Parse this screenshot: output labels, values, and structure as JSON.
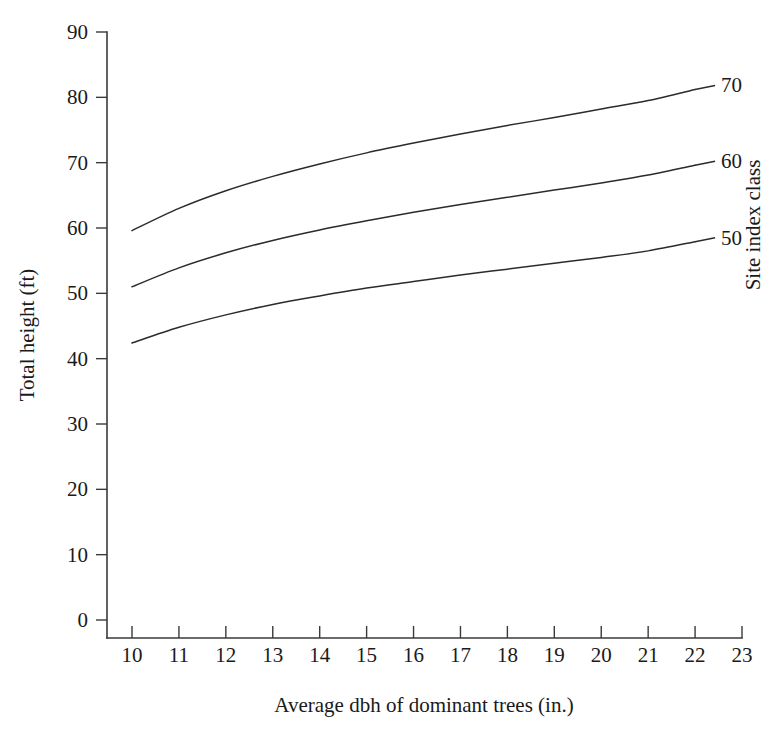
{
  "chart_data": {
    "type": "line",
    "title": "",
    "xlabel": "Average dbh of dominant trees (in.)",
    "ylabel": "Total height (ft)",
    "legend_title": "Site index class",
    "legend_position": "right-of-curve-ends",
    "grid": false,
    "xlim": [
      10,
      23
    ],
    "ylim": [
      0,
      90
    ],
    "xticks": [
      10,
      11,
      12,
      13,
      14,
      15,
      16,
      17,
      18,
      19,
      20,
      21,
      22,
      23
    ],
    "yticks": [
      0,
      10,
      20,
      30,
      40,
      50,
      60,
      70,
      80,
      90
    ],
    "xtick_labels": [
      "10",
      "11",
      "12",
      "13",
      "14",
      "15",
      "16",
      "17",
      "18",
      "19",
      "20",
      "21",
      "22",
      "23"
    ],
    "ytick_labels": [
      "0",
      "10",
      "20",
      "30",
      "40",
      "50",
      "60",
      "70",
      "80",
      "90"
    ],
    "x": [
      10,
      11,
      12,
      13,
      14,
      15,
      16,
      17,
      18,
      19,
      20,
      21,
      22
    ],
    "series": [
      {
        "name": "70",
        "label": "70",
        "values": [
          59.6,
          63.0,
          65.7,
          67.9,
          69.8,
          71.5,
          73.0,
          74.4,
          75.7,
          76.9,
          78.2,
          79.5,
          81.2
        ]
      },
      {
        "name": "60",
        "label": "60",
        "values": [
          51.0,
          53.9,
          56.2,
          58.1,
          59.7,
          61.1,
          62.4,
          63.6,
          64.7,
          65.8,
          66.9,
          68.1,
          69.6
        ]
      },
      {
        "name": "50",
        "label": "50",
        "values": [
          42.4,
          44.8,
          46.7,
          48.3,
          49.6,
          50.8,
          51.8,
          52.8,
          53.7,
          54.6,
          55.5,
          56.5,
          57.9
        ]
      }
    ],
    "annotations": [
      {
        "text": "70",
        "anchor_series": "70"
      },
      {
        "text": "60",
        "anchor_series": "60"
      },
      {
        "text": "50",
        "anchor_series": "50"
      }
    ]
  }
}
